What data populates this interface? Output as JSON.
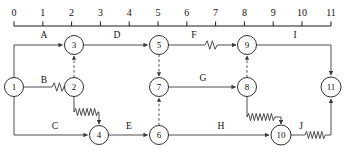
{
  "diagram": {
    "kind": "aoe-network-diagram",
    "title": "",
    "width": 355,
    "height": 158,
    "colors": {
      "line": "#3a3a3a",
      "node_stroke": "#1a1a1a",
      "node_fill": "#ffffff",
      "text": "#111111",
      "axis": "#1a1a1a",
      "background": "#ffffff"
    }
  },
  "axis": {
    "name": "time-scale",
    "orientation": "horizontal",
    "min": 0,
    "max": 11,
    "origin_x": 14,
    "unit_px": 28.8,
    "baseline_y": 26,
    "tick_height": 5,
    "label_y": 15,
    "ticks": [
      {
        "value": 0,
        "label": "0"
      },
      {
        "value": 1,
        "label": "1"
      },
      {
        "value": 2,
        "label": "2"
      },
      {
        "value": 3,
        "label": "3"
      },
      {
        "value": 4,
        "label": "4"
      },
      {
        "value": 5,
        "label": "5"
      },
      {
        "value": 6,
        "label": "6"
      },
      {
        "value": 7,
        "label": "7"
      },
      {
        "value": 8,
        "label": "8"
      },
      {
        "value": 9,
        "label": "9"
      },
      {
        "value": 10,
        "label": "10"
      },
      {
        "value": 11,
        "label": "11"
      }
    ]
  },
  "nodes": [
    {
      "id": "1",
      "label": "1",
      "x": 14,
      "y": 87,
      "r": 9.5
    },
    {
      "id": "2",
      "label": "2",
      "x": 74,
      "y": 87,
      "r": 9.5
    },
    {
      "id": "3",
      "label": "3",
      "x": 74,
      "y": 45,
      "r": 9.5
    },
    {
      "id": "4",
      "label": "4",
      "x": 99,
      "y": 135,
      "r": 9.5
    },
    {
      "id": "5",
      "label": "5",
      "x": 159,
      "y": 45,
      "r": 9.5
    },
    {
      "id": "6",
      "label": "6",
      "x": 159,
      "y": 135,
      "r": 9.5
    },
    {
      "id": "7",
      "label": "7",
      "x": 159,
      "y": 87,
      "r": 9.5
    },
    {
      "id": "8",
      "label": "8",
      "x": 247,
      "y": 87,
      "r": 9.5
    },
    {
      "id": "9",
      "label": "9",
      "x": 247,
      "y": 45,
      "r": 9.5
    },
    {
      "id": "10",
      "label": "10",
      "x": 281,
      "y": 135,
      "r": 10
    },
    {
      "id": "11",
      "label": "11",
      "x": 331,
      "y": 87,
      "r": 10
    }
  ],
  "edges": [
    {
      "id": "A",
      "label": "A",
      "from": "1",
      "to": "3",
      "style": "solid",
      "wavy": false,
      "label_x": 44,
      "label_y": 38
    },
    {
      "id": "B",
      "label": "B",
      "from": "1",
      "to": "2",
      "style": "solid",
      "wavy": true,
      "label_x": 44,
      "label_y": 83
    },
    {
      "id": "C",
      "label": "C",
      "from": "1",
      "to": "4",
      "style": "solid",
      "wavy": false,
      "label_x": 55,
      "label_y": 129
    },
    {
      "id": "D",
      "label": "D",
      "from": "3",
      "to": "5",
      "style": "solid",
      "wavy": false,
      "label_x": 117,
      "label_y": 38
    },
    {
      "id": "E",
      "label": "E",
      "from": "4",
      "to": "6",
      "style": "solid",
      "wavy": false,
      "label_x": 129,
      "label_y": 129
    },
    {
      "id": "F",
      "label": "F",
      "from": "5",
      "to": "9",
      "style": "solid",
      "wavy": true,
      "label_x": 194,
      "label_y": 38
    },
    {
      "id": "G",
      "label": "G",
      "from": "7",
      "to": "8",
      "style": "solid",
      "wavy": false,
      "label_x": 203,
      "label_y": 81
    },
    {
      "id": "H",
      "label": "H",
      "from": "6",
      "to": "10",
      "style": "solid",
      "wavy": false,
      "label_x": 221,
      "label_y": 129
    },
    {
      "id": "I",
      "label": "I",
      "from": "9",
      "to": "11",
      "style": "solid",
      "wavy": false,
      "label_x": 295,
      "label_y": 38
    },
    {
      "id": "J",
      "label": "J",
      "from": "10",
      "to": "11",
      "style": "solid",
      "wavy": true,
      "label_x": 301,
      "label_y": 129
    }
  ],
  "dummy_edges": [
    {
      "id": "d2-3",
      "from": "2",
      "to": "3",
      "direction": "up"
    },
    {
      "id": "d5-7",
      "from": "5",
      "to": "7",
      "direction": "down"
    },
    {
      "id": "d6-7",
      "from": "6",
      "to": "7",
      "direction": "up"
    },
    {
      "id": "d8-9",
      "from": "8",
      "to": "9",
      "direction": "up"
    }
  ],
  "slack_links": [
    {
      "id": "s2-4",
      "from": "2",
      "to": "4",
      "wavy": true
    },
    {
      "id": "s8-10",
      "from": "8",
      "to": "10",
      "wavy": true
    }
  ]
}
